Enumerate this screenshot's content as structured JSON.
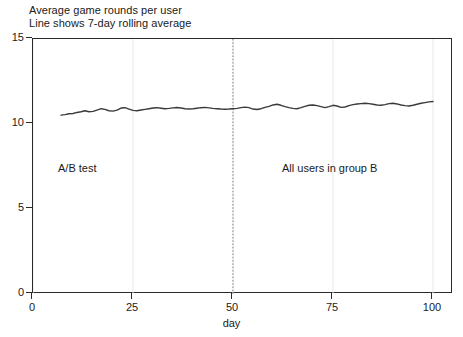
{
  "figure": {
    "title_lines": [
      "Average game rounds per user",
      "Line shows 7-day rolling average"
    ],
    "xaxis_label": "day",
    "annotation_left": "A/B test",
    "annotation_right": "All users in group B",
    "line_color": "#3a3a3a",
    "axis_color": "#2b2b2b",
    "grid_color": "#e8e8e8",
    "divider_color": "#808080"
  },
  "chart_data": {
    "type": "line",
    "title": "Average game rounds per user",
    "subtitle": "Line shows 7-day rolling average",
    "xlabel": "day",
    "ylabel": "",
    "xlim": [
      0,
      105
    ],
    "ylim": [
      0,
      15
    ],
    "xticks": [
      0,
      25,
      50,
      75,
      100
    ],
    "yticks": [
      0,
      5,
      10,
      15
    ],
    "grid": true,
    "legend": "none",
    "annotations": [
      {
        "text": "A/B test",
        "x": 7,
        "y": 7.1
      },
      {
        "text": "All users in group B",
        "x": 60,
        "y": 7.1
      },
      {
        "text": "experiment-split divider",
        "x": 50,
        "y": null,
        "style": "dotted-vline"
      }
    ],
    "series": [
      {
        "name": "7-day rolling average game rounds per user",
        "x": [
          7,
          8,
          9,
          10,
          11,
          12,
          13,
          14,
          15,
          16,
          17,
          18,
          19,
          20,
          21,
          22,
          23,
          24,
          25,
          26,
          27,
          28,
          29,
          30,
          31,
          32,
          33,
          34,
          35,
          36,
          37,
          38,
          39,
          40,
          41,
          42,
          43,
          44,
          45,
          46,
          47,
          48,
          49,
          50,
          51,
          52,
          53,
          54,
          55,
          56,
          57,
          58,
          59,
          60,
          61,
          62,
          63,
          64,
          65,
          66,
          67,
          68,
          69,
          70,
          71,
          72,
          73,
          74,
          75,
          76,
          77,
          78,
          79,
          80,
          81,
          82,
          83,
          84,
          85,
          86,
          87,
          88,
          89,
          90,
          91,
          92,
          93,
          94,
          95,
          96,
          97,
          98,
          99,
          100
        ],
        "values": [
          10.52,
          10.55,
          10.6,
          10.62,
          10.68,
          10.72,
          10.78,
          10.72,
          10.74,
          10.82,
          10.9,
          10.86,
          10.78,
          10.76,
          10.82,
          10.94,
          10.96,
          10.88,
          10.8,
          10.78,
          10.82,
          10.86,
          10.9,
          10.94,
          10.96,
          10.93,
          10.9,
          10.92,
          10.95,
          10.97,
          10.94,
          10.9,
          10.88,
          10.9,
          10.93,
          10.96,
          10.98,
          10.95,
          10.92,
          10.9,
          10.88,
          10.87,
          10.88,
          10.9,
          10.92,
          10.96,
          10.99,
          10.96,
          10.88,
          10.85,
          10.9,
          10.98,
          11.04,
          11.12,
          11.16,
          11.1,
          11.02,
          10.96,
          10.92,
          10.9,
          10.96,
          11.04,
          11.1,
          11.12,
          11.08,
          11.02,
          10.96,
          11.02,
          11.1,
          11.06,
          10.98,
          11.0,
          11.08,
          11.14,
          11.18,
          11.2,
          11.22,
          11.2,
          11.16,
          11.12,
          11.1,
          11.14,
          11.2,
          11.22,
          11.18,
          11.12,
          11.08,
          11.06,
          11.1,
          11.16,
          11.22,
          11.26,
          11.3,
          11.32
        ]
      }
    ]
  }
}
